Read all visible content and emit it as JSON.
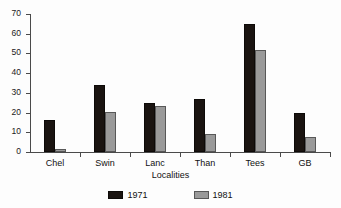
{
  "chart_data": {
    "type": "bar",
    "title": "",
    "subtitle": "",
    "xlabel": "Localities",
    "ylabel": "",
    "categories": [
      "Chel",
      "Swin",
      "Lanc",
      "Than",
      "Tees",
      "GB"
    ],
    "series": [
      {
        "name": "1971",
        "color": "#1a1411",
        "values": [
          16,
          34,
          25,
          27,
          65,
          20
        ]
      },
      {
        "name": "1981",
        "color": "#9a9a9a",
        "values": [
          1.5,
          20.5,
          23.5,
          9,
          52,
          7.5
        ]
      }
    ],
    "ylim": [
      0,
      70
    ],
    "yticks": [
      0,
      10,
      20,
      30,
      40,
      50,
      60,
      70
    ],
    "ytick_labels": [
      "0",
      "10",
      "20",
      "30",
      "40",
      "50",
      "60",
      "70"
    ],
    "grid": false,
    "legend_position": "bottom",
    "legend_entries": [
      "1971",
      "1981"
    ],
    "axis_color": "#4a4a4a",
    "background": "#fdfdfd"
  }
}
